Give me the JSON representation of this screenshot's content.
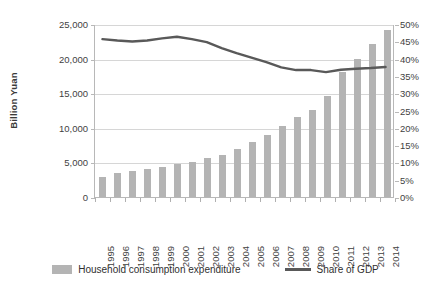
{
  "chart_data": {
    "type": "bar",
    "title": "",
    "xlabel": "",
    "ylabel": "Billion Yuan",
    "y2label": "",
    "categories": [
      "1995",
      "1996",
      "1997",
      "1998",
      "1999",
      "2000",
      "2001",
      "2002",
      "2003",
      "2004",
      "2005",
      "2006",
      "2007",
      "2008",
      "2009",
      "2010",
      "2011",
      "2012",
      "2013",
      "2014"
    ],
    "ylim": [
      0,
      25000
    ],
    "y2lim": [
      0,
      0.5
    ],
    "grid": true,
    "legend_position": "bottom",
    "left_ticks": [
      "0",
      "5,000",
      "10,000",
      "15,000",
      "20,000",
      "25,000"
    ],
    "left_tick_values": [
      0,
      5000,
      10000,
      15000,
      20000,
      25000
    ],
    "right_ticks": [
      "0%",
      "5%",
      "10%",
      "15%",
      "20%",
      "25%",
      "30%",
      "35%",
      "40%",
      "45%",
      "50%"
    ],
    "right_tick_values": [
      0,
      0.05,
      0.1,
      0.15,
      0.2,
      0.25,
      0.3,
      0.35,
      0.4,
      0.45,
      0.5
    ],
    "series": [
      {
        "name": "Household consumption expenditure",
        "type": "bar",
        "axis": "left",
        "color": "#b4b4b4",
        "values": [
          2900,
          3500,
          3800,
          4000,
          4300,
          4800,
          5100,
          5600,
          6100,
          7000,
          7900,
          9000,
          10300,
          11500,
          12600,
          14600,
          18100,
          20000,
          22100,
          24200
        ]
      },
      {
        "name": "Share of GDP",
        "type": "line",
        "axis": "right",
        "color": "#595959",
        "values": [
          0.459,
          0.455,
          0.452,
          0.455,
          0.461,
          0.466,
          0.459,
          0.45,
          0.433,
          0.418,
          0.405,
          0.392,
          0.377,
          0.369,
          0.369,
          0.363,
          0.37,
          0.373,
          0.375,
          0.378
        ]
      }
    ]
  },
  "legend": {
    "bar_label": "Household consumption expenditure",
    "line_label": "Share of GDP"
  }
}
